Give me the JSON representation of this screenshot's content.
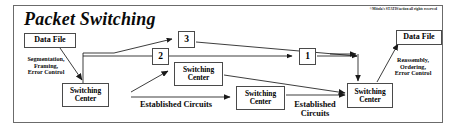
{
  "figure": {
    "title": "Packet Switching",
    "copyright": "©Mitola's STATIS/action all rights reserved"
  },
  "boxes": {
    "data_file_left": "Data File",
    "data_file_right": "Data File",
    "switching_center_left": "Switching\nCenter",
    "switching_center_middle": "Switching\nCenter",
    "switching_center_lower": "Switching\nCenter",
    "switching_center_right": "Switching\nCenter",
    "packet_3": "3",
    "packet_2": "2",
    "packet_1": "1"
  },
  "annotations": {
    "segmentation": "Segmentation,\nFraming,\nError Control",
    "reassembly": "Reassembly,\nOrdering,\nError Control",
    "established_circuits_left": "Established Circuits",
    "established_circuits_right": "Established\nCircuits"
  },
  "colors": {
    "frame_border": "#6b6b6b",
    "box_border": "#4a4a4a",
    "line": "#1a1a1a",
    "text": "#0a0a0a",
    "background": "#ffffff"
  }
}
